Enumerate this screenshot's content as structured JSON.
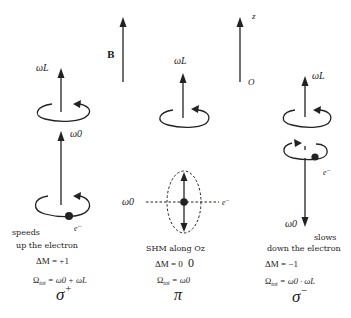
{
  "figure": {
    "reference_axes": {
      "field_label": "B",
      "axis_label": "z",
      "origin_label": "O"
    },
    "panels": [
      {
        "id": "sigma_plus",
        "precession_label": "ωL",
        "orbital_label": "ω0",
        "electron_label": "e⁻",
        "description_line1": "speeds",
        "description_line2": "up the electron",
        "delta_m": "ΔM = +1",
        "omega_tot_prefix": "Ω",
        "omega_tot_sub": "tot",
        "omega_tot_rest": " = ω0 + ωL",
        "polarization": "σ",
        "polarization_sup": "+"
      },
      {
        "id": "pi",
        "precession_label": "ωL",
        "orbital_label": "ω0",
        "electron_label": "e⁻",
        "description_line1": "SHM along Oz",
        "delta_m": "ΔM = 0",
        "delta_m_extra": "0",
        "omega_tot_prefix": "Ω",
        "omega_tot_sub": "tot",
        "omega_tot_rest": " = ω0",
        "polarization": "π"
      },
      {
        "id": "sigma_minus",
        "precession_label": "ωL",
        "orbital_label": "ω0",
        "electron_label": "e⁻",
        "description_line1": "slows",
        "description_line2": "down the electron",
        "delta_m": "ΔM = −1",
        "omega_tot_prefix": "Ω",
        "omega_tot_sub": "tot",
        "omega_tot_rest": " = ω0 · ωL",
        "polarization": "σ",
        "polarization_sup": "−"
      }
    ]
  }
}
